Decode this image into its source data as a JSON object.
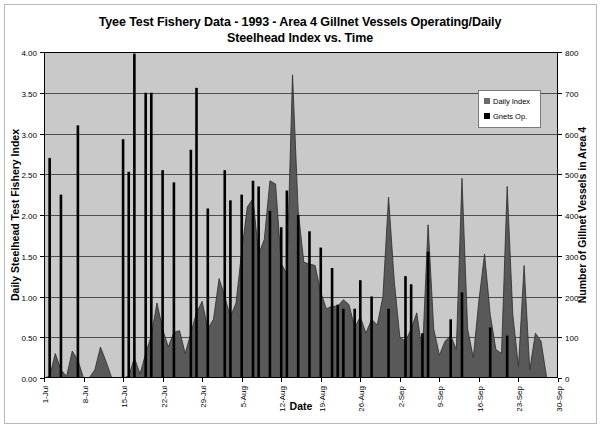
{
  "chart_data": {
    "type": "line",
    "title": "Tyee Test Fishery Data - 1993 - Area 4 Gillnet Vessels Operating/Daily Steelhead Index vs. Time",
    "title_line1": "Tyee Test Fishery Data - 1993 - Area 4 Gillnet Vessels Operating/Daily",
    "title_line2": "Steelhead Index vs. Time",
    "xlabel": "Date",
    "ylabel": "Daily Steelhead Test Fishery Index",
    "ylabel_right": "Number of Gillnet Vessels in Area 4",
    "ylim": [
      0,
      4
    ],
    "ylim_right": [
      0,
      800
    ],
    "ytick_labels": [
      "0.00",
      "0.50",
      "1.00",
      "1.50",
      "2.00",
      "2.50",
      "3.00",
      "3.50",
      "4.00"
    ],
    "ytick_values": [
      0,
      0.5,
      1.0,
      1.5,
      2.0,
      2.5,
      3.0,
      3.5,
      4.0
    ],
    "ytick_right_labels": [
      "0",
      "100",
      "200",
      "300",
      "400",
      "500",
      "600",
      "700",
      "800"
    ],
    "ytick_right_values": [
      0,
      100,
      200,
      300,
      400,
      500,
      600,
      700,
      800
    ],
    "grid": true,
    "legend_position": "upper right",
    "xtick_labels": [
      "1-Jul",
      "8-Jul",
      "15-Jul",
      "22-Jul",
      "29-Jul",
      "5-Aug",
      "12-Aug",
      "19-Aug",
      "26-Aug",
      "2-Sep",
      "9-Sep",
      "16-Sep",
      "23-Sep",
      "30-Sep"
    ],
    "xtick_indices": [
      0,
      7,
      14,
      21,
      28,
      35,
      42,
      49,
      56,
      63,
      70,
      77,
      84,
      91
    ],
    "n_points": 92,
    "colors": {
      "daily_index_fill": "#595959",
      "gnets_bar": "#000000",
      "plot_background": "#c9c9c9",
      "grid_line": "#4d4d4d",
      "frame": "#000000"
    },
    "series": [
      {
        "name": "Daily Index",
        "type": "area",
        "axis": "left",
        "color": "#595959",
        "values": [
          0.0,
          0.02,
          0.3,
          0.1,
          0.02,
          0.33,
          0.22,
          0.0,
          0.0,
          0.1,
          0.38,
          0.2,
          0.0,
          0.0,
          0.0,
          0.02,
          0.25,
          0.05,
          0.3,
          0.52,
          0.92,
          0.6,
          0.38,
          0.56,
          0.58,
          0.3,
          0.55,
          0.8,
          0.94,
          0.6,
          0.72,
          1.22,
          1.0,
          0.75,
          0.92,
          1.55,
          2.1,
          2.2,
          1.52,
          1.7,
          2.42,
          2.38,
          1.4,
          1.28,
          3.72,
          2.05,
          1.42,
          1.4,
          1.38,
          1.05,
          0.85,
          0.88,
          0.88,
          0.96,
          0.9,
          0.62,
          0.75,
          0.55,
          0.72,
          0.65,
          1.0,
          2.22,
          1.2,
          0.5,
          0.45,
          0.6,
          0.8,
          0.3,
          1.88,
          0.6,
          0.28,
          0.45,
          0.52,
          0.35,
          2.45,
          0.6,
          0.25,
          0.95,
          1.52,
          0.78,
          0.35,
          0.3,
          2.35,
          0.78,
          0.14,
          1.38,
          0.1,
          0.55,
          0.45,
          0.0,
          0.0,
          0.0
        ]
      },
      {
        "name": "Gnets Op.",
        "type": "bar",
        "axis": "right",
        "color": "#000000",
        "values_left_scale": [
          null,
          2.7,
          null,
          2.25,
          null,
          null,
          3.1,
          null,
          null,
          null,
          null,
          null,
          null,
          null,
          2.93,
          2.53,
          3.98,
          null,
          3.5,
          3.5,
          null,
          2.55,
          null,
          2.4,
          null,
          null,
          2.8,
          3.56,
          null,
          2.08,
          null,
          null,
          2.55,
          2.18,
          null,
          2.25,
          null,
          2.42,
          2.35,
          null,
          2.05,
          null,
          1.85,
          2.3,
          null,
          2.0,
          null,
          1.8,
          null,
          1.6,
          null,
          1.35,
          0.9,
          0.85,
          null,
          0.85,
          1.2,
          null,
          1.0,
          null,
          null,
          0.85,
          null,
          null,
          1.25,
          1.15,
          null,
          0.55,
          1.55,
          null,
          null,
          null,
          0.72,
          null,
          1.05,
          null,
          null,
          null,
          null,
          0.62,
          null,
          null,
          0.52,
          null,
          null,
          null,
          null,
          null,
          null,
          null,
          null,
          null
        ],
        "values": [
          null,
          540,
          null,
          450,
          null,
          null,
          620,
          null,
          null,
          null,
          null,
          null,
          null,
          null,
          586,
          506,
          796,
          null,
          700,
          700,
          null,
          510,
          null,
          480,
          null,
          null,
          560,
          712,
          null,
          416,
          null,
          null,
          510,
          436,
          null,
          450,
          null,
          484,
          470,
          null,
          410,
          null,
          370,
          460,
          null,
          400,
          null,
          360,
          null,
          320,
          null,
          270,
          180,
          170,
          null,
          170,
          240,
          null,
          200,
          null,
          null,
          170,
          null,
          null,
          250,
          230,
          null,
          110,
          310,
          null,
          null,
          null,
          144,
          null,
          210,
          null,
          null,
          null,
          null,
          124,
          null,
          null,
          104,
          null,
          null,
          null,
          null,
          null,
          null,
          null,
          null,
          null
        ]
      }
    ],
    "legend": [
      {
        "label": "Daily Index",
        "color": "#6b6b6b"
      },
      {
        "label": "Gnets Op.",
        "color": "#000000"
      }
    ]
  }
}
